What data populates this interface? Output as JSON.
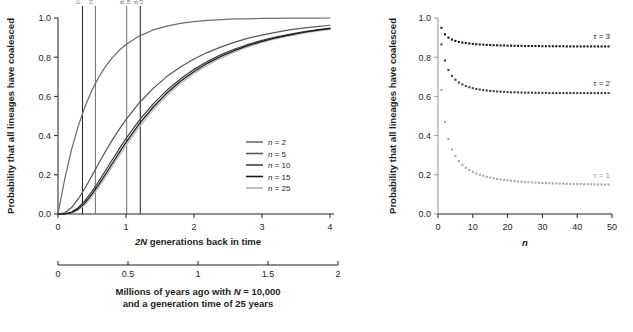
{
  "figure": {
    "background": "#ffffff",
    "ink": "#231f20"
  },
  "left_panel": {
    "ylabel": "Probability that all lineages have coalesced",
    "xlabel_parts": {
      "italic": "2N",
      "rest": " generations back in time"
    },
    "xlabel_full": "2N generations back in time",
    "yticks": [
      "0.0",
      "0.2",
      "0.4",
      "0.6",
      "0.8",
      "1.0"
    ],
    "ytickvals": [
      0.0,
      0.2,
      0.4,
      0.6,
      0.8,
      1.0
    ],
    "xticks": [
      "0",
      "1",
      "2",
      "3",
      "4"
    ],
    "xtickvals": [
      0,
      1,
      2,
      3,
      4
    ],
    "vlines": [
      {
        "label": "Denisova/neanderthal",
        "x": 0.36,
        "color": "#6d6e71",
        "lines": [
          "Denisova/neanderthal"
        ]
      },
      {
        "label": "Human/neanderthal",
        "x": 0.55,
        "color": "#6d6e71",
        "lines": [
          "Human/neanderthal"
        ]
      },
      {
        "label": "Bornean/Sumatran orangutans",
        "x": 1.01,
        "color": "#6d6e71",
        "lines": [
          "Bornean/Sumatran",
          "orangutans"
        ]
      },
      {
        "label": "Bonobo/chimpanzee",
        "x": 1.21,
        "color": "#6d6e71",
        "lines": [
          "Bonobo/",
          "chimpanzee"
        ]
      }
    ],
    "legend": {
      "title": "",
      "items": [
        {
          "label": "n = 2",
          "n": 2,
          "color": "#6d6e71"
        },
        {
          "label": "n = 5",
          "n": 5,
          "color": "#58595b"
        },
        {
          "label": "n = 10",
          "n": 10,
          "color": "#404041"
        },
        {
          "label": "n = 15",
          "n": 15,
          "color": "#1a1a1a"
        },
        {
          "label": "n = 25",
          "n": 25,
          "color": "#bcbec0"
        }
      ]
    }
  },
  "secondary_axis": {
    "caption_line1_parts": {
      "pre": "Millions of years ago with ",
      "italic": "N",
      "post": " = 10,000"
    },
    "caption_line1": "Millions of years ago with N = 10,000",
    "caption_line2": "and a generation time of 25 years",
    "ticks": [
      "0",
      "0.5",
      "1",
      "1.5",
      "2"
    ],
    "tickvals": [
      0,
      0.5,
      1,
      1.5,
      2
    ]
  },
  "right_panel": {
    "ylabel": "Probability that all lineages have coalesced",
    "xlabel": "n",
    "yticks": [
      "0.0",
      "0.2",
      "0.4",
      "0.6",
      "0.8",
      "1.0"
    ],
    "ytickvals": [
      0.0,
      0.2,
      0.4,
      0.6,
      0.8,
      1.0
    ],
    "xticks": [
      "0",
      "10",
      "20",
      "30",
      "40",
      "50"
    ],
    "xtickvals": [
      0,
      10,
      20,
      30,
      40,
      50
    ],
    "series_labels": [
      {
        "label": "τ = 3",
        "tau": 3,
        "color": "#1a1a1a",
        "y": 0.855
      },
      {
        "label": "τ = 2",
        "tau": 2,
        "color": "#404041",
        "y": 0.618
      },
      {
        "label": "τ = 1",
        "tau": 1,
        "color": "#a7a9ac",
        "y": 0.147
      }
    ]
  },
  "chart_data": [
    {
      "type": "line",
      "id": "left-coalescence-curves",
      "title": "",
      "xlabel": "2N generations back in time",
      "ylabel": "Probability that all lineages have coalesced",
      "xlim": [
        0,
        4
      ],
      "ylim": [
        0,
        1
      ],
      "grid": false,
      "legend_position": "right-inside",
      "annotations": [
        {
          "text": "Denisova/neanderthal",
          "x": 0.36,
          "rotation": -90
        },
        {
          "text": "Human/neanderthal",
          "x": 0.55,
          "rotation": -90
        },
        {
          "text": "Bornean/Sumatran orangutans",
          "x": 1.01,
          "rotation": -90
        },
        {
          "text": "Bonobo/chimpanzee",
          "x": 1.21,
          "rotation": -90
        }
      ],
      "x": [
        0,
        0.1,
        0.2,
        0.3,
        0.4,
        0.5,
        0.6,
        0.7,
        0.8,
        0.9,
        1.0,
        1.2,
        1.4,
        1.6,
        1.8,
        2.0,
        2.2,
        2.4,
        2.6,
        2.8,
        3.0,
        3.2,
        3.4,
        3.6,
        3.8,
        4.0
      ],
      "series": [
        {
          "name": "n = 2",
          "color": "#6d6e71",
          "values": [
            0.0,
            0.181,
            0.33,
            0.451,
            0.551,
            0.632,
            0.699,
            0.753,
            0.798,
            0.835,
            0.865,
            0.909,
            0.939,
            0.959,
            0.973,
            0.982,
            0.988,
            0.992,
            0.995,
            0.996,
            0.998,
            0.998,
            0.999,
            0.999,
            0.999,
            1.0
          ]
        },
        {
          "name": "n = 5",
          "color": "#58595b",
          "values": [
            0.0,
            0.006,
            0.033,
            0.078,
            0.134,
            0.196,
            0.259,
            0.32,
            0.378,
            0.432,
            0.482,
            0.569,
            0.641,
            0.701,
            0.75,
            0.791,
            0.825,
            0.853,
            0.877,
            0.897,
            0.913,
            0.927,
            0.939,
            0.948,
            0.956,
            0.963
          ]
        },
        {
          "name": "n = 10",
          "color": "#404041",
          "values": [
            0.0,
            0.001,
            0.01,
            0.033,
            0.069,
            0.115,
            0.167,
            0.222,
            0.278,
            0.332,
            0.385,
            0.48,
            0.562,
            0.631,
            0.689,
            0.738,
            0.779,
            0.813,
            0.842,
            0.866,
            0.886,
            0.903,
            0.917,
            0.929,
            0.939,
            0.948
          ]
        },
        {
          "name": "n = 15",
          "color": "#1a1a1a",
          "values": [
            0.0,
            0.0,
            0.007,
            0.026,
            0.058,
            0.101,
            0.151,
            0.204,
            0.259,
            0.313,
            0.366,
            0.462,
            0.546,
            0.617,
            0.677,
            0.727,
            0.77,
            0.805,
            0.835,
            0.86,
            0.881,
            0.899,
            0.913,
            0.926,
            0.937,
            0.946
          ]
        },
        {
          "name": "n = 25",
          "color": "#bcbec0",
          "values": [
            0.0,
            0.0,
            0.005,
            0.021,
            0.05,
            0.09,
            0.138,
            0.19,
            0.244,
            0.298,
            0.351,
            0.447,
            0.532,
            0.605,
            0.666,
            0.718,
            0.761,
            0.797,
            0.828,
            0.854,
            0.876,
            0.894,
            0.909,
            0.922,
            0.934,
            0.943
          ]
        }
      ]
    },
    {
      "type": "scatter",
      "id": "right-vs-n",
      "title": "",
      "xlabel": "n",
      "ylabel": "Probability that all lineages have coalesced",
      "xlim": [
        0,
        50
      ],
      "ylim": [
        0,
        1
      ],
      "grid": false,
      "legend_position": "inline-right",
      "x": [
        1,
        2,
        3,
        4,
        5,
        6,
        7,
        8,
        9,
        10,
        11,
        12,
        13,
        14,
        15,
        16,
        17,
        18,
        19,
        20,
        21,
        22,
        23,
        24,
        25,
        26,
        27,
        28,
        29,
        30,
        31,
        32,
        33,
        34,
        35,
        36,
        37,
        38,
        39,
        40,
        41,
        42,
        43,
        44,
        45,
        46,
        47,
        48,
        49
      ],
      "series": [
        {
          "name": "τ = 3",
          "tau": 3,
          "color": "#1a1a1a",
          "values": [
            0.95,
            0.917,
            0.9,
            0.89,
            0.883,
            0.878,
            0.875,
            0.872,
            0.87,
            0.868,
            0.866,
            0.865,
            0.864,
            0.863,
            0.862,
            0.861,
            0.861,
            0.86,
            0.86,
            0.859,
            0.859,
            0.858,
            0.858,
            0.858,
            0.857,
            0.857,
            0.857,
            0.857,
            0.857,
            0.856,
            0.856,
            0.856,
            0.856,
            0.856,
            0.856,
            0.856,
            0.855,
            0.855,
            0.855,
            0.855,
            0.855,
            0.855,
            0.855,
            0.855,
            0.855,
            0.855,
            0.855,
            0.855,
            0.855
          ]
        },
        {
          "name": "τ = 2",
          "tau": 2,
          "color": "#404041",
          "values": [
            0.865,
            0.783,
            0.735,
            0.705,
            0.685,
            0.671,
            0.661,
            0.653,
            0.647,
            0.642,
            0.638,
            0.635,
            0.632,
            0.63,
            0.628,
            0.627,
            0.625,
            0.624,
            0.623,
            0.622,
            0.621,
            0.621,
            0.62,
            0.62,
            0.619,
            0.619,
            0.619,
            0.618,
            0.618,
            0.618,
            0.618,
            0.617,
            0.617,
            0.617,
            0.617,
            0.617,
            0.617,
            0.617,
            0.617,
            0.617,
            0.617,
            0.617,
            0.617,
            0.617,
            0.617,
            0.617,
            0.617,
            0.617,
            0.617
          ]
        },
        {
          "name": "τ = 1",
          "tau": 1,
          "color": "#a7a9ac",
          "values": [
            0.632,
            0.47,
            0.383,
            0.33,
            0.295,
            0.27,
            0.251,
            0.236,
            0.224,
            0.215,
            0.207,
            0.2,
            0.195,
            0.19,
            0.186,
            0.182,
            0.179,
            0.176,
            0.174,
            0.172,
            0.17,
            0.168,
            0.166,
            0.165,
            0.163,
            0.162,
            0.161,
            0.16,
            0.159,
            0.158,
            0.158,
            0.157,
            0.156,
            0.156,
            0.155,
            0.155,
            0.154,
            0.154,
            0.153,
            0.153,
            0.153,
            0.152,
            0.152,
            0.152,
            0.151,
            0.151,
            0.151,
            0.15,
            0.15
          ]
        }
      ]
    }
  ]
}
